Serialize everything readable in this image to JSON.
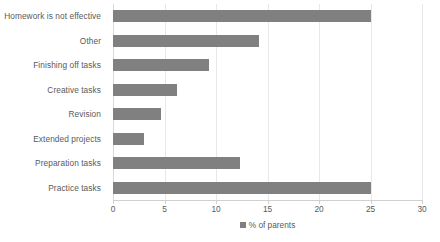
{
  "chart_data": {
    "type": "bar",
    "orientation": "horizontal",
    "title": "",
    "xlabel": "",
    "ylabel": "",
    "xlim": [
      0,
      30
    ],
    "xticks": [
      0,
      5,
      10,
      15,
      20,
      25,
      30
    ],
    "grid": true,
    "legend_position": "bottom",
    "categories": [
      "Homework is not effective",
      "Other",
      "Finishing off tasks",
      "Creative tasks",
      "Revision",
      "Extended projects",
      "Preparation tasks",
      "Practice tasks"
    ],
    "values": [
      25,
      14.2,
      9.3,
      6.2,
      4.7,
      3,
      12.3,
      25
    ],
    "series": [
      {
        "name": "% of parents",
        "values": [
          25,
          14.2,
          9.3,
          6.2,
          4.7,
          3,
          12.3,
          25
        ],
        "color": "#808080"
      }
    ]
  },
  "legend": {
    "entries": [
      {
        "label": "% of parents",
        "color": "#808080"
      }
    ]
  },
  "colors": {
    "bar": "#808080",
    "text": "#5a5a5a",
    "gridline": "#e8e8e8",
    "axis": "#d0d0d0",
    "background": "#ffffff"
  }
}
